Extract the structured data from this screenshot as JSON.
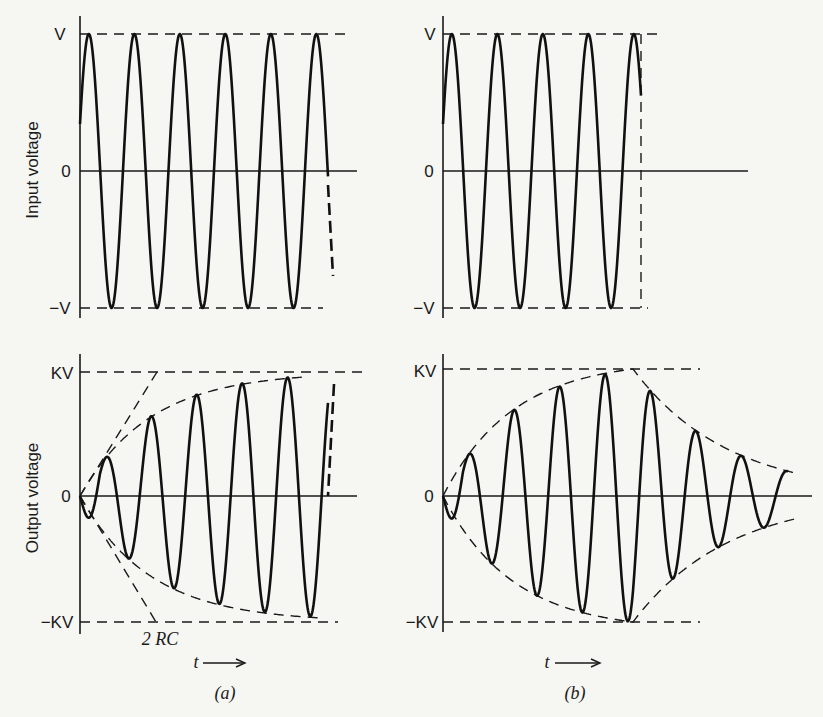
{
  "figure": {
    "panels": [
      {
        "id": "a",
        "caption": "(a)",
        "input_plot": {
          "ylabel": "Input voltage",
          "ticks": {
            "top": "V",
            "mid": "0",
            "bottom": "−V"
          }
        },
        "output_plot": {
          "ylabel": "Output voltage",
          "ticks": {
            "top": "KV",
            "mid": "0",
            "bottom": "−KV"
          },
          "annotation": "2 RC",
          "time_axis": "t"
        }
      },
      {
        "id": "b",
        "caption": "(b)",
        "input_plot": {
          "ticks": {
            "top": "V",
            "mid": "0",
            "bottom": "−V"
          }
        },
        "output_plot": {
          "ticks": {
            "top": "KV",
            "mid": "0",
            "bottom": "−KV"
          },
          "time_axis": "t"
        }
      }
    ]
  },
  "chart_data": [
    {
      "type": "line",
      "title": "(a) Input voltage",
      "ylabel": "Input voltage",
      "xlabel": "t",
      "ytick_labels": [
        "V",
        "0",
        "-V"
      ],
      "description": "Sinusoid of constant amplitude V, ~6 cycles shown, continuing (dashed) beyond the plot",
      "amplitude": 1.0,
      "cycles": 6.3
    },
    {
      "type": "line",
      "title": "(a) Output voltage",
      "ylabel": "Output voltage",
      "xlabel": "t",
      "ytick_labels": [
        "KV",
        "0",
        "-KV"
      ],
      "description": "Sinusoid whose amplitude envelope builds up exponentially toward KV; initial tangent intercept at 2RC",
      "envelope": "KV(1 - e^(-t/2RC))",
      "annotation": "2RC",
      "peak_amplitudes": [
        0.33,
        0.63,
        0.8,
        0.9,
        0.96,
        1.0
      ]
    },
    {
      "type": "line",
      "title": "(b) Input voltage",
      "ylabel": "",
      "xlabel": "t",
      "ytick_labels": [
        "V",
        "0",
        "-V"
      ],
      "description": "Sinusoid of amplitude V, ~4.5 cycles, switched off at a time marked by dashed vertical line",
      "amplitude": 1.0,
      "cycles": 4.5
    },
    {
      "type": "line",
      "title": "(b) Output voltage",
      "ylabel": "",
      "xlabel": "t",
      "ytick_labels": [
        "KV",
        "0",
        "-KV"
      ],
      "description": "Amplitude builds toward KV while input is on, then decays exponentially (ringing) after input is removed",
      "peak_amplitudes_buildup": [
        0.38,
        0.66,
        0.84,
        0.95,
        1.0
      ],
      "peak_amplitudes_decay": [
        0.68,
        0.44,
        0.31,
        0.16
      ]
    }
  ]
}
